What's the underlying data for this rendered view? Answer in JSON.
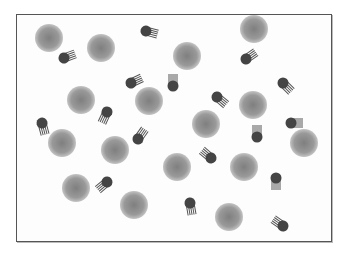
{
  "diagram": {
    "type": "particle-dispersion",
    "colors": {
      "sphere_center": "#7f7f7f",
      "sphere_edge": "#c4c4c4",
      "head": "#444444",
      "tail": "#555555",
      "frame": "#555555"
    },
    "spheres": [
      {
        "x": 49,
        "y": 38,
        "r": 14
      },
      {
        "x": 101,
        "y": 48,
        "r": 14
      },
      {
        "x": 187,
        "y": 56,
        "r": 14
      },
      {
        "x": 254,
        "y": 29,
        "r": 14
      },
      {
        "x": 81,
        "y": 100,
        "r": 14
      },
      {
        "x": 149,
        "y": 101,
        "r": 14
      },
      {
        "x": 206,
        "y": 124,
        "r": 14
      },
      {
        "x": 253,
        "y": 105,
        "r": 14
      },
      {
        "x": 62,
        "y": 143,
        "r": 14
      },
      {
        "x": 115,
        "y": 150,
        "r": 14
      },
      {
        "x": 304,
        "y": 143,
        "r": 14
      },
      {
        "x": 177,
        "y": 167,
        "r": 14
      },
      {
        "x": 244,
        "y": 167,
        "r": 14
      },
      {
        "x": 76,
        "y": 188,
        "r": 14
      },
      {
        "x": 134,
        "y": 205,
        "r": 14
      },
      {
        "x": 229,
        "y": 217,
        "r": 14
      }
    ],
    "molecules": [
      {
        "x": 64,
        "y": 58,
        "angle": -20
      },
      {
        "x": 146,
        "y": 31,
        "angle": 15
      },
      {
        "x": 131,
        "y": 83,
        "angle": -25
      },
      {
        "x": 173,
        "y": 86,
        "angle": -90
      },
      {
        "x": 246,
        "y": 59,
        "angle": -35
      },
      {
        "x": 283,
        "y": 83,
        "angle": 45
      },
      {
        "x": 107,
        "y": 112,
        "angle": 115
      },
      {
        "x": 42,
        "y": 123,
        "angle": 75
      },
      {
        "x": 217,
        "y": 97,
        "angle": 40
      },
      {
        "x": 138,
        "y": 139,
        "angle": -55
      },
      {
        "x": 211,
        "y": 158,
        "angle": -140
      },
      {
        "x": 291,
        "y": 123,
        "angle": 0
      },
      {
        "x": 257,
        "y": 137,
        "angle": -90
      },
      {
        "x": 107,
        "y": 182,
        "angle": 140
      },
      {
        "x": 190,
        "y": 203,
        "angle": 80
      },
      {
        "x": 276,
        "y": 178,
        "angle": 90
      },
      {
        "x": 283,
        "y": 226,
        "angle": -145
      }
    ]
  }
}
